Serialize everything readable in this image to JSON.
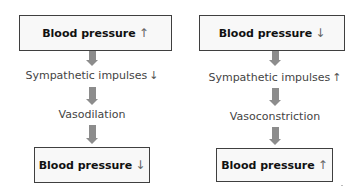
{
  "flowcharts": [
    {
      "name": "left",
      "top_box": {
        "text": "Blood pressure",
        "arrow": "↑"
      },
      "step1": {
        "text": "Sympathetic impulses",
        "arrow": "↓"
      },
      "step2": {
        "text": "Vasodilation"
      },
      "bottom_box": {
        "text": "Blood pressure",
        "arrow": "↓"
      }
    },
    {
      "name": "right",
      "top_box": {
        "text": "Blood pressure",
        "arrow": "↓"
      },
      "step1": {
        "text": "Sympathetic impulses",
        "arrow": "↑"
      },
      "step2": {
        "text": "Vasoconstriction"
      },
      "bottom_box": {
        "text": "Blood pressure",
        "arrow": "↑"
      }
    }
  ],
  "colors": {
    "box_border": "#3f3f3f",
    "box_fill": "#f8f8f8",
    "flow_arrow": "#8c8c8c"
  }
}
